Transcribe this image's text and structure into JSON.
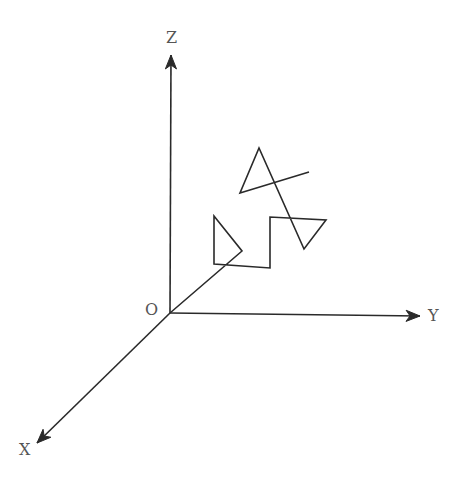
{
  "diagram": {
    "type": "3d-coordinate-axes-with-curve",
    "colors": {
      "line": "#2a2a2a",
      "label": "#555555",
      "background": "#ffffff"
    },
    "origin": {
      "label": "O",
      "x": 170,
      "y": 313
    },
    "axes": [
      {
        "name": "z-axis",
        "label": "Z",
        "from": [
          170,
          313
        ],
        "to": [
          171,
          55
        ],
        "label_pos": [
          166,
          30
        ]
      },
      {
        "name": "y-axis",
        "label": "Y",
        "from": [
          170,
          313
        ],
        "to": [
          420,
          316
        ],
        "label_pos": [
          428,
          308
        ]
      },
      {
        "name": "x-axis",
        "label": "X",
        "from": [
          170,
          313
        ],
        "to": [
          37,
          443
        ],
        "label_pos": [
          19,
          442
        ]
      }
    ],
    "curve": {
      "name": "polyline-path",
      "points": [
        [
          170,
          313
        ],
        [
          242,
          251
        ],
        [
          214,
          216
        ],
        [
          214,
          264
        ],
        [
          270,
          268
        ],
        [
          270,
          217
        ],
        [
          326,
          220
        ],
        [
          304,
          249
        ],
        [
          259,
          148
        ],
        [
          240,
          193
        ],
        [
          309,
          172
        ]
      ]
    }
  }
}
